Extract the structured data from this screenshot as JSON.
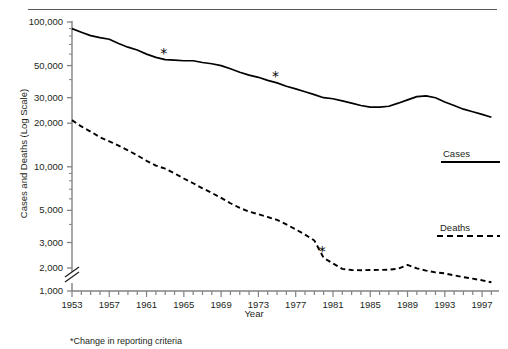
{
  "figure": {
    "footnote": "*Change in reporting criteria"
  },
  "chart_data": {
    "type": "line",
    "title": "",
    "xlabel": "Year",
    "ylabel": "Cases and Deaths (Log Scale)",
    "yscale": "log",
    "ylim": [
      1000,
      100000
    ],
    "y_axis_break": "between 1,000 and 2,000",
    "ytick_labels": [
      "100,000",
      "50,000",
      "30,000",
      "20,000",
      "10,000",
      "5,000",
      "3,000",
      "2,000",
      "1,000"
    ],
    "ytick_values": [
      100000,
      50000,
      30000,
      20000,
      10000,
      5000,
      3000,
      2000,
      1000
    ],
    "xlim": [
      1953,
      1998
    ],
    "xtick_labels": [
      "1953",
      "1957",
      "1961",
      "1965",
      "1969",
      "1973",
      "1977",
      "1981",
      "1985",
      "1989",
      "1993",
      "1997"
    ],
    "xtick_values": [
      1953,
      1957,
      1961,
      1965,
      1969,
      1973,
      1977,
      1981,
      1985,
      1989,
      1993,
      1997
    ],
    "minor_ticks": "every year",
    "grid": false,
    "legend_position": "right",
    "x": [
      1953,
      1954,
      1955,
      1956,
      1957,
      1958,
      1959,
      1960,
      1961,
      1962,
      1963,
      1964,
      1965,
      1966,
      1967,
      1968,
      1969,
      1970,
      1971,
      1972,
      1973,
      1974,
      1975,
      1976,
      1977,
      1978,
      1979,
      1980,
      1981,
      1982,
      1983,
      1984,
      1985,
      1986,
      1987,
      1988,
      1989,
      1990,
      1991,
      1992,
      1993,
      1994,
      1995,
      1996,
      1997,
      1998
    ],
    "series": [
      {
        "name": "Cases",
        "style": "solid",
        "color": "#000000",
        "values": [
          90000,
          85000,
          80500,
          78000,
          76000,
          71000,
          67000,
          64000,
          60000,
          57000,
          55000,
          54500,
          54000,
          54000,
          52500,
          51500,
          50000,
          47500,
          45000,
          43000,
          41500,
          39500,
          38000,
          36000,
          34500,
          33000,
          31500,
          30000,
          29500,
          28500,
          27500,
          26500,
          25800,
          25800,
          26200,
          27500,
          29000,
          30500,
          30900,
          30000,
          28000,
          26500,
          25000,
          24000,
          23000,
          22000
        ]
      },
      {
        "name": "Deaths",
        "style": "dashed",
        "color": "#000000",
        "values": [
          21000,
          19000,
          17500,
          16000,
          15000,
          14000,
          13000,
          12000,
          11000,
          10200,
          9700,
          9000,
          8300,
          7700,
          7100,
          6600,
          6100,
          5600,
          5200,
          4900,
          4700,
          4500,
          4300,
          4000,
          3700,
          3400,
          3100,
          2350,
          2150,
          1950,
          1880,
          1870,
          1880,
          1890,
          1900,
          1960,
          2100,
          1980,
          1850,
          1750,
          1700,
          1600,
          1520,
          1450,
          1380,
          1300
        ]
      }
    ],
    "annotations": [
      {
        "label": "*",
        "series": "Cases",
        "x": 1963,
        "y": 55000,
        "note": "Change in reporting criteria"
      },
      {
        "label": "*",
        "series": "Cases",
        "x": 1975,
        "y": 38000,
        "note": "Change in reporting criteria"
      },
      {
        "label": "*",
        "series": "Deaths",
        "x": 1980,
        "y": 2350,
        "note": "Change in reporting criteria"
      }
    ],
    "legend": [
      {
        "label": "Cases",
        "style": "solid"
      },
      {
        "label": "Deaths",
        "style": "dashed"
      }
    ]
  }
}
